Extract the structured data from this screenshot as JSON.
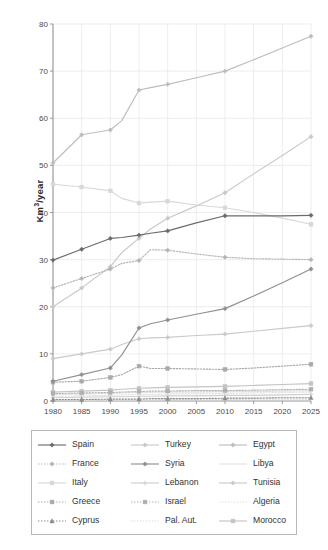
{
  "axes": {
    "ylabel": "Km³/year",
    "ylabel_base": "Km",
    "ylabel_sup": "3",
    "ylabel_tail": "/year",
    "xlabel": "",
    "yticks": [
      0,
      10,
      20,
      30,
      40,
      50,
      60,
      70,
      80
    ],
    "xticks": [
      1980,
      1985,
      1990,
      1995,
      2000,
      2005,
      2010,
      2015,
      2020,
      2025
    ],
    "ylim": [
      0,
      80
    ],
    "xlim": [
      1980,
      2025
    ],
    "grid": true
  },
  "legend": {
    "position": "below-plot",
    "columns": 3,
    "entries": [
      {
        "label": "Spain",
        "color": "#6b6b6b",
        "dash": "none",
        "marker": "diamond"
      },
      {
        "label": "Turkey",
        "color": "#c9c9c9",
        "dash": "none",
        "marker": "diamond"
      },
      {
        "label": "Egypt",
        "color": "#bdbdbd",
        "dash": "none",
        "marker": "diamond"
      },
      {
        "label": "France",
        "color": "#b4b4b4",
        "dash": "dot",
        "marker": "diamond"
      },
      {
        "label": "Syria",
        "color": "#909090",
        "dash": "none",
        "marker": "diamond"
      },
      {
        "label": "Libya",
        "color": "#e2e2e2",
        "dash": "none",
        "marker": "none"
      },
      {
        "label": "Italy",
        "color": "#d8d8d8",
        "dash": "none",
        "marker": "square"
      },
      {
        "label": "Lebanon",
        "color": "#cfcfcf",
        "dash": "none",
        "marker": "plus"
      },
      {
        "label": "Tunisia",
        "color": "#cacaca",
        "dash": "none",
        "marker": "diamond"
      },
      {
        "label": "Greece",
        "color": "#a9a9a9",
        "dash": "dot",
        "marker": "square"
      },
      {
        "label": "Israel",
        "color": "#b0b0b0",
        "dash": "dot",
        "marker": "square"
      },
      {
        "label": "Algeria",
        "color": "#e0e0e0",
        "dash": "dot",
        "marker": "none"
      },
      {
        "label": "Cyprus",
        "color": "#8c8c8c",
        "dash": "dot",
        "marker": "triangle"
      },
      {
        "label": "Pal. Aut.",
        "color": "#dcdcdc",
        "dash": "dot",
        "marker": "none"
      },
      {
        "label": "Morocco",
        "color": "#c4c4c4",
        "dash": "none",
        "marker": "square"
      }
    ]
  },
  "chart_data": {
    "type": "line",
    "title": "",
    "xlabel": "",
    "ylabel": "Km³/year",
    "xlim": [
      1980,
      2025
    ],
    "ylim": [
      0,
      80
    ],
    "grid": true,
    "x": [
      1980,
      1985,
      1990,
      1992,
      1995,
      1997,
      2000,
      2005,
      2010,
      2015,
      2020,
      2025
    ],
    "series": [
      {
        "name": "Egypt",
        "color": "#bdbdbd",
        "values": [
          50.5,
          56.5,
          57.5,
          59.5,
          66.0,
          66.5,
          67.2,
          68.6,
          70.0,
          72.4,
          74.9,
          77.4
        ]
      },
      {
        "name": "Turkey",
        "color": "#c9c9c9",
        "values": [
          20.0,
          24.0,
          28.5,
          31.5,
          34.5,
          36.5,
          38.8,
          41.4,
          44.2,
          48.2,
          52.1,
          56.1
        ]
      },
      {
        "name": "Italy",
        "color": "#d8d8d8",
        "values": [
          46.0,
          45.4,
          44.6,
          43.0,
          42.0,
          42.2,
          42.4,
          41.6,
          41.0,
          40.0,
          38.8,
          37.5
        ]
      },
      {
        "name": "Spain",
        "color": "#6b6b6b",
        "values": [
          29.9,
          32.2,
          34.5,
          34.7,
          35.2,
          35.6,
          36.1,
          37.8,
          39.3,
          39.3,
          39.3,
          39.4
        ]
      },
      {
        "name": "France",
        "color": "#b4b4b4",
        "values": [
          24.0,
          26.0,
          28.0,
          29.2,
          29.8,
          32.1,
          32.0,
          31.2,
          30.5,
          30.2,
          30.1,
          30.0
        ]
      },
      {
        "name": "Syria",
        "color": "#909090",
        "values": [
          4.2,
          5.6,
          7.0,
          9.8,
          15.5,
          16.4,
          17.2,
          18.4,
          19.6,
          22.3,
          25.1,
          28.0
        ]
      },
      {
        "name": "Tunisia",
        "color": "#cacaca",
        "values": [
          9.0,
          10.0,
          11.0,
          12.0,
          13.2,
          13.4,
          13.5,
          13.9,
          14.2,
          14.8,
          15.4,
          16.0
        ]
      },
      {
        "name": "Greece",
        "color": "#a9a9a9",
        "values": [
          4.0,
          4.2,
          5.0,
          5.6,
          7.4,
          6.9,
          6.9,
          6.8,
          6.7,
          7.0,
          7.4,
          7.8
        ]
      },
      {
        "name": "Morocco",
        "color": "#c4c4c4",
        "values": [
          1.9,
          2.1,
          2.3,
          2.5,
          2.7,
          2.8,
          2.9,
          3.0,
          3.1,
          3.3,
          3.5,
          3.7
        ]
      },
      {
        "name": "Israel",
        "color": "#b0b0b0",
        "values": [
          1.6,
          1.7,
          1.8,
          1.9,
          2.0,
          2.1,
          2.1,
          2.2,
          2.2,
          2.3,
          2.4,
          2.5
        ]
      },
      {
        "name": "Libya",
        "color": "#e2e2e2",
        "values": [
          1.4,
          1.5,
          1.6,
          1.7,
          1.8,
          1.8,
          1.9,
          1.9,
          2.0,
          2.0,
          2.1,
          2.2
        ]
      },
      {
        "name": "Algeria",
        "color": "#e0e0e0",
        "values": [
          1.0,
          1.1,
          1.2,
          1.3,
          1.4,
          1.4,
          1.5,
          1.5,
          1.6,
          1.7,
          1.8,
          1.9
        ]
      },
      {
        "name": "Lebanon",
        "color": "#cfcfcf",
        "values": [
          0.7,
          0.8,
          0.9,
          0.9,
          1.0,
          1.0,
          1.1,
          1.1,
          1.2,
          1.2,
          1.3,
          1.4
        ]
      },
      {
        "name": "Cyprus",
        "color": "#8c8c8c",
        "values": [
          0.3,
          0.3,
          0.4,
          0.4,
          0.4,
          0.5,
          0.5,
          0.5,
          0.6,
          0.6,
          0.7,
          0.7
        ]
      },
      {
        "name": "Pal. Aut.",
        "color": "#dcdcdc",
        "values": [
          0.1,
          0.1,
          0.2,
          0.2,
          0.2,
          0.2,
          0.3,
          0.3,
          0.3,
          0.4,
          0.4,
          0.4
        ]
      }
    ]
  }
}
